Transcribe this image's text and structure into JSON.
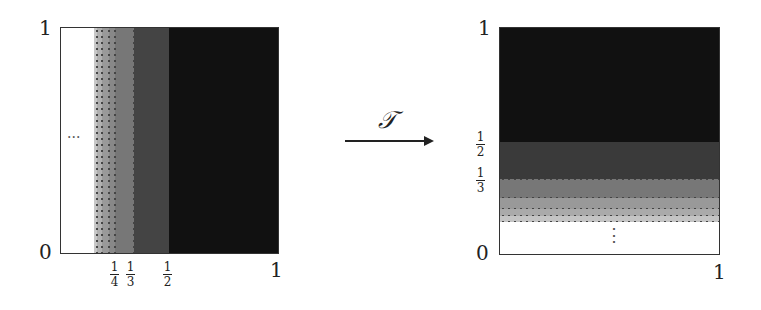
{
  "left_panel": {
    "y_axis": {
      "top_label": "1",
      "bottom_label": "0"
    },
    "x_axis": {
      "right_label": "1"
    },
    "ellipsis": "···",
    "fractions": [
      {
        "num": "1",
        "den": "4"
      },
      {
        "num": "1",
        "den": "3"
      },
      {
        "num": "1",
        "den": "2"
      }
    ],
    "bands": [
      {
        "from": 0,
        "to": "...",
        "color": "#ffffff"
      },
      {
        "color": "#c8c8c8"
      },
      {
        "color": "#b0b0b0"
      },
      {
        "color": "#999999"
      },
      {
        "color": "#888888"
      },
      {
        "from": "1/4",
        "to": "1/3",
        "color": "#777777"
      },
      {
        "from": "1/3",
        "to": "1/2",
        "color": "#444444"
      },
      {
        "from": "1/2",
        "to": "1",
        "color": "#111111"
      }
    ]
  },
  "map": {
    "symbol": "𝒯"
  },
  "right_panel": {
    "y_axis": {
      "top_label": "1",
      "bottom_label": "0"
    },
    "x_axis": {
      "right_label": "1"
    },
    "ellipsis": "⋮",
    "fractions": [
      {
        "num": "1",
        "den": "2"
      },
      {
        "num": "1",
        "den": "3"
      }
    ],
    "bands": [
      {
        "from": "1/2",
        "to": "1",
        "color": "#111111"
      },
      {
        "from": "1/3",
        "to": "1/2",
        "color": "#3a3a3a"
      },
      {
        "color": "#777777"
      },
      {
        "color": "#999999"
      },
      {
        "color": "#aaaaaa"
      },
      {
        "color": "#c4c4c4"
      },
      {
        "from": 0,
        "to": "...",
        "color": "#ffffff"
      }
    ]
  }
}
